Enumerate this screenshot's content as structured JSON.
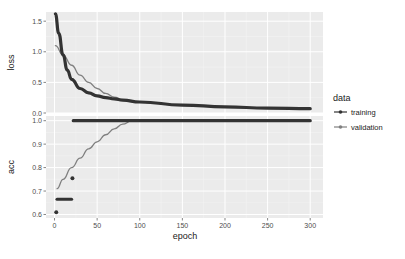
{
  "chart_data": {
    "type": "line",
    "layout": "faceted (2 stacked panels, shared x-axis)",
    "xlabel": "epoch",
    "x_ticks": [
      0,
      50,
      100,
      150,
      200,
      250,
      300
    ],
    "xlim": [
      0,
      300
    ],
    "legend": {
      "title": "data",
      "position": "right",
      "entries": [
        "training",
        "validation"
      ]
    },
    "grid": true,
    "panels": [
      {
        "ylabel": "loss",
        "y_ticks": [
          "0.0",
          "0.5",
          "1.0",
          "1.5"
        ],
        "ylim": [
          0.0,
          1.65
        ],
        "series": [
          {
            "name": "training",
            "color": "#333333",
            "x": [
              1,
              5,
              10,
              15,
              20,
              30,
              40,
              50,
              60,
              70,
              80,
              100,
              150,
              200,
              250,
              300
            ],
            "values": [
              1.62,
              1.3,
              0.95,
              0.7,
              0.55,
              0.4,
              0.33,
              0.28,
              0.25,
              0.23,
              0.21,
              0.18,
              0.13,
              0.1,
              0.08,
              0.07
            ]
          },
          {
            "name": "validation",
            "color": "#808080",
            "x": [
              1,
              10,
              20,
              30,
              40,
              50,
              60,
              70,
              80,
              100,
              150,
              200,
              250,
              300
            ],
            "values": [
              1.1,
              0.95,
              0.78,
              0.62,
              0.5,
              0.4,
              0.32,
              0.26,
              0.22,
              0.18,
              0.13,
              0.1,
              0.08,
              0.07
            ]
          }
        ]
      },
      {
        "ylabel": "acc",
        "y_ticks": [
          "0.6",
          "0.7",
          "0.8",
          "0.9",
          "1.0"
        ],
        "ylim": [
          0.585,
          1.02
        ],
        "series": [
          {
            "name": "training",
            "color": "#333333",
            "segments": [
              {
                "x": [
                  2
                ],
                "values": [
                  0.61
                ]
              },
              {
                "x": [
                  3,
                  20
                ],
                "values": [
                  0.665,
                  0.665
                ]
              },
              {
                "x": [
                  21
                ],
                "values": [
                  0.755
                ]
              },
              {
                "x": [
                  22,
                  300
                ],
                "values": [
                  1.0,
                  1.0
                ]
              }
            ]
          },
          {
            "name": "validation",
            "color": "#808080",
            "x": [
              3,
              10,
              20,
              30,
              40,
              50,
              60,
              70,
              80,
              90,
              100,
              150,
              200,
              250,
              300
            ],
            "values": [
              0.71,
              0.75,
              0.8,
              0.84,
              0.88,
              0.91,
              0.94,
              0.965,
              0.985,
              0.998,
              1.0,
              1.0,
              1.0,
              1.0,
              1.0
            ]
          }
        ]
      }
    ]
  }
}
